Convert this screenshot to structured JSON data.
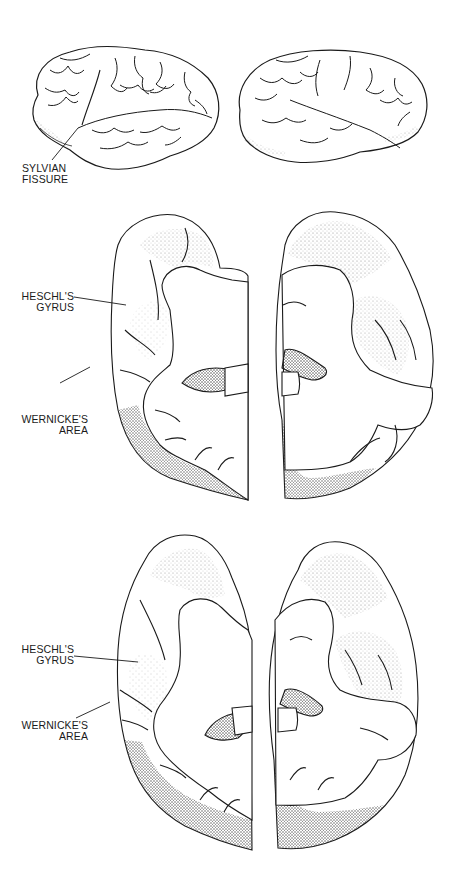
{
  "figure": {
    "panels": [
      {
        "id": "lateral-views",
        "description": "Lateral views of left and right cerebral hemispheres",
        "labels": [
          {
            "line1": "SYLVIAN",
            "line2": "FISSURE"
          }
        ]
      },
      {
        "id": "horizontal-section-1",
        "description": "Horizontal section through temporal lobes (upper)",
        "labels": [
          {
            "line1": "HESCHL'S",
            "line2": "GYRUS"
          },
          {
            "line1": "WERNICKE'S",
            "line2": "AREA"
          }
        ]
      },
      {
        "id": "horizontal-section-2",
        "description": "Horizontal section through temporal lobes (lower)",
        "labels": [
          {
            "line1": "HESCHL'S",
            "line2": "GYRUS"
          },
          {
            "line1": "WERNICKE'S",
            "line2": "AREA"
          }
        ]
      }
    ],
    "colors": {
      "ink": "#1a1a1a",
      "stipple": "#8a8a8a",
      "background": "#ffffff"
    }
  }
}
